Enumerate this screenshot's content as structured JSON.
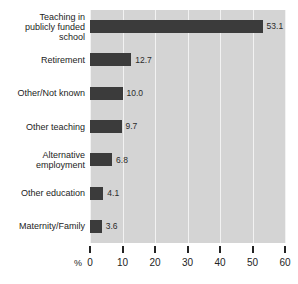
{
  "chart_data": {
    "type": "bar",
    "orientation": "horizontal",
    "title": "",
    "xlabel": "%",
    "ylabel": "",
    "xlim": [
      0,
      60
    ],
    "grid": true,
    "legend": null,
    "categories": [
      "Teaching in\npublicly funded\nschool",
      "Retirement",
      "Other/Not known",
      "Other teaching",
      "Alternative\nemployment",
      "Other education",
      "Maternity/Family"
    ],
    "values": [
      53.1,
      12.7,
      10.0,
      9.7,
      6.8,
      4.1,
      3.6
    ],
    "value_labels": [
      "53.1",
      "12.7",
      "10.0",
      "9.7",
      "6.8",
      "4.1",
      "3.6"
    ],
    "xticks": [
      0,
      10,
      20,
      30,
      40,
      50,
      60
    ],
    "xtick_labels": [
      "0",
      "10",
      "20",
      "30",
      "40",
      "50",
      "60"
    ],
    "colors": {
      "bar": "#3b3b3b",
      "plot_background": "#d4d4d4",
      "gridline": "#f2f2f2",
      "text": "#232323",
      "page_background": "#ffffff"
    }
  }
}
